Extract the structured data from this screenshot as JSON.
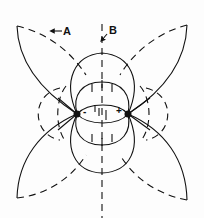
{
  "diagram": {
    "type": "electric-dipole-field-lines",
    "labels": {
      "A": "A",
      "B": "B"
    },
    "charges": [
      {
        "sign": "-",
        "x": 77,
        "y": 114
      },
      {
        "sign": "+",
        "x": 128,
        "y": 114
      }
    ],
    "legend_hint": {
      "solid": "field lines",
      "dashed": "equipotential lines"
    },
    "colors": {
      "ink": "#111111",
      "background": "#fdfdfd"
    }
  }
}
